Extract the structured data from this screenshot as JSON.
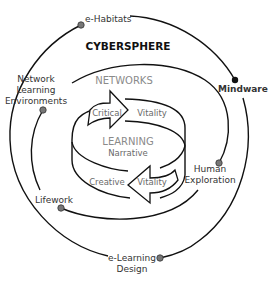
{
  "diagram": {
    "title": "CYBERSPHERE",
    "outer_ring_nodes": [
      {
        "label": "e-Habitats",
        "dot": "grey"
      },
      {
        "label": "Mindware",
        "dot": "black"
      },
      {
        "label": "e-Learning Design",
        "lines": [
          "e-Learning",
          "Design"
        ],
        "dot": "grey"
      }
    ],
    "middle_ring_nodes": [
      {
        "label": "Network Learning Environments",
        "lines": [
          "Network",
          "Learning",
          "Environments"
        ],
        "dot": "grey"
      },
      {
        "label": "Human Exploration",
        "lines": [
          "Human",
          "Exploration"
        ],
        "dot": "grey"
      },
      {
        "label": "Lifework",
        "dot": "grey"
      }
    ],
    "inner": {
      "ring_title": "NETWORKS",
      "core_title": "LEARNING",
      "core_subtitle": "Narrative",
      "top_arrow": {
        "left": "Critical",
        "right": "Vitality"
      },
      "bottom_arrow": {
        "left": "Creative",
        "right": "Vitality"
      }
    },
    "colors": {
      "line": "#111111",
      "dot_grey": "#777777",
      "dot_black": "#111111",
      "text_dark": "#111111",
      "text_grey": "#8a8a8a"
    }
  }
}
